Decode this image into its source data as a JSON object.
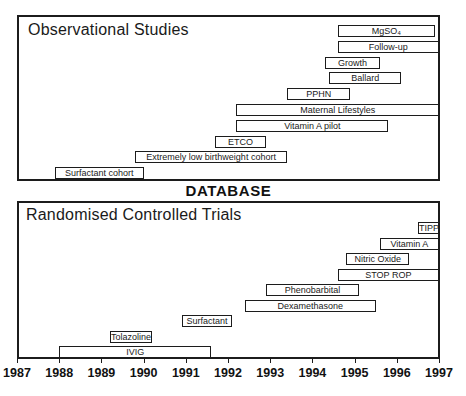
{
  "figure": {
    "divider_label": "DATABASE"
  },
  "chart_data": {
    "type": "bar",
    "variant": "gantt-timeline",
    "title": "",
    "xlabel": "Year",
    "xlim": [
      1987,
      1997
    ],
    "x_ticks": [
      1987,
      1988,
      1989,
      1990,
      1991,
      1992,
      1993,
      1994,
      1995,
      1996,
      1997
    ],
    "grid": false,
    "panels": [
      {
        "title": "Observational Studies",
        "bars": [
          {
            "label": "MgSO₄",
            "start": 1994.6,
            "end": 1996.9
          },
          {
            "label": "Follow-up",
            "start": 1994.6,
            "end": 1997.0
          },
          {
            "label": "Growth",
            "start": 1994.3,
            "end": 1995.6
          },
          {
            "label": "Ballard",
            "start": 1994.4,
            "end": 1996.1
          },
          {
            "label": "PPHN",
            "start": 1993.4,
            "end": 1994.9
          },
          {
            "label": "Maternal Lifestyles",
            "start": 1992.2,
            "end": 1997.0
          },
          {
            "label": "Vitamin A pilot",
            "start": 1992.2,
            "end": 1995.8
          },
          {
            "label": "ETCO",
            "start": 1991.7,
            "end": 1992.9
          },
          {
            "label": "Extremely low birthweight cohort",
            "start": 1989.8,
            "end": 1993.4
          },
          {
            "label": "Surfactant cohort",
            "start": 1987.9,
            "end": 1990.0
          }
        ]
      },
      {
        "title": "Randomised Controlled Trials",
        "bars": [
          {
            "label": "TIPP",
            "start": 1996.5,
            "end": 1997.0
          },
          {
            "label": "Vitamin A",
            "start": 1995.6,
            "end": 1997.0
          },
          {
            "label": "Nitric Oxide",
            "start": 1994.8,
            "end": 1996.3
          },
          {
            "label": "STOP ROP",
            "start": 1994.6,
            "end": 1997.0
          },
          {
            "label": "Phenobarbital",
            "start": 1992.9,
            "end": 1995.1
          },
          {
            "label": "Dexamethasone",
            "start": 1992.4,
            "end": 1995.5
          },
          {
            "label": "Surfactant",
            "start": 1990.9,
            "end": 1992.1
          },
          {
            "label": "Tolazoline",
            "start": 1989.2,
            "end": 1990.2
          },
          {
            "label": "IVIG",
            "start": 1988.0,
            "end": 1991.6
          }
        ]
      }
    ]
  }
}
